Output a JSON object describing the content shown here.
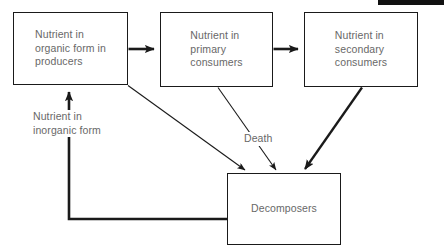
{
  "diagram": {
    "stroke_color": "#1a1a1a",
    "text_color": "#686868",
    "background_color": "#ffffff",
    "nodes": [
      {
        "id": "producers",
        "label": "Nutrient in\norganic form in\nproducers",
        "x": 13,
        "y": 12,
        "w": 115,
        "h": 73,
        "align": "left"
      },
      {
        "id": "primary-consumers",
        "label": "Nutrient in\nprimary\nconsumers",
        "x": 160,
        "y": 12,
        "w": 113,
        "h": 75,
        "align": "left"
      },
      {
        "id": "secondary-consumers",
        "label": "Nutrient in\nsecondary\nconsumers",
        "x": 304,
        "y": 12,
        "w": 114,
        "h": 75,
        "align": "left"
      },
      {
        "id": "decomposers",
        "label": "Decomposers",
        "x": 227,
        "y": 173,
        "w": 114,
        "h": 72,
        "align": "center"
      }
    ],
    "free_labels": [
      {
        "id": "inorganic-form",
        "text": "Nutrient in\ninorganic form",
        "x": 33,
        "y": 110
      },
      {
        "id": "death",
        "text": "Death",
        "x": 244,
        "y": 132
      }
    ],
    "edges": [
      {
        "id": "producers-to-primary",
        "from": "producers",
        "to": "primary-consumers",
        "weight": "thick",
        "type": "straight"
      },
      {
        "id": "primary-to-secondary",
        "from": "primary-consumers",
        "to": "secondary-consumers",
        "weight": "thick",
        "type": "straight"
      },
      {
        "id": "producers-to-decomposers",
        "from": "producers",
        "to": "decomposers",
        "weight": "thin",
        "type": "diagonal"
      },
      {
        "id": "primary-to-decomposers",
        "from": "primary-consumers",
        "to": "decomposers",
        "weight": "thin",
        "type": "diagonal"
      },
      {
        "id": "secondary-to-decomposers",
        "from": "secondary-consumers",
        "to": "decomposers",
        "weight": "thick",
        "type": "diagonal"
      },
      {
        "id": "decomposers-to-producers",
        "from": "decomposers",
        "to": "producers",
        "weight": "thick",
        "type": "elbow"
      }
    ]
  },
  "corner_mark": {
    "x": 378,
    "y": 0,
    "w": 66,
    "h": 5
  }
}
